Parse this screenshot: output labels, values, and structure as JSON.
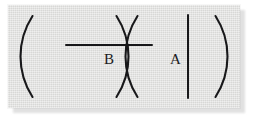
{
  "figure": {
    "kind": "math-expression-image",
    "card": {
      "background_color": "#dcdcda",
      "shadow_color": "#c9c9c9",
      "ink_color": "#18181a"
    },
    "expression_plain": "( / B )( A | )",
    "groups": [
      {
        "id": "group-left",
        "open_paren": "(",
        "close_paren": ")",
        "content_kind": "fraction",
        "numerator": "",
        "fraction_bar": "—",
        "denominator": "B"
      },
      {
        "id": "group-right",
        "open_paren": "(",
        "close_paren": ")",
        "content_kind": "variable-with-bar",
        "variable": "A",
        "vertical_bar": "|"
      }
    ],
    "symbols": {
      "denominator_label": "B",
      "variable_label": "A",
      "open_paren_glyph": "(",
      "close_paren_glyph": ")",
      "fraction_bar_glyph": "─",
      "vertical_bar_glyph": "│"
    }
  }
}
